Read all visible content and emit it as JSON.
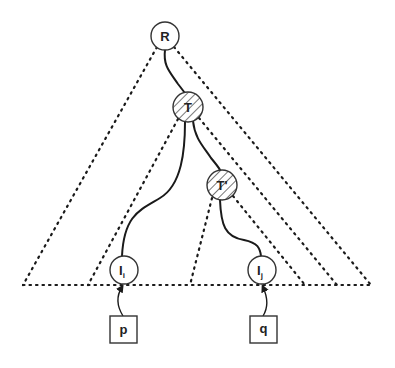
{
  "diagram": {
    "title": "",
    "colors": {
      "stroke": "#2a2a2a",
      "node_fill": "#ffffff",
      "hatch": "#555555",
      "background": "#ffffff"
    },
    "nodes": [
      {
        "id": "R",
        "label": "R",
        "cx": 165,
        "cy": 36,
        "r": 14,
        "hatched": false
      },
      {
        "id": "T",
        "label": "T",
        "cx": 188,
        "cy": 107,
        "r": 15,
        "hatched": true
      },
      {
        "id": "T_prime",
        "label": "T'",
        "cx": 222,
        "cy": 185,
        "r": 15,
        "hatched": true
      },
      {
        "id": "I_i",
        "label": "I",
        "sub": "i",
        "cx": 124,
        "cy": 270,
        "r": 14,
        "hatched": false
      },
      {
        "id": "I_j",
        "label": "I",
        "sub": "j",
        "cx": 262,
        "cy": 270,
        "r": 14,
        "hatched": false
      }
    ],
    "boxes": [
      {
        "id": "p",
        "label": "p",
        "x": 110,
        "y": 316,
        "w": 27,
        "h": 27
      },
      {
        "id": "q",
        "label": "q",
        "x": 250,
        "y": 316,
        "w": 27,
        "h": 27
      }
    ],
    "solid_edges": [
      {
        "from": "R",
        "to": "T"
      },
      {
        "from": "T",
        "to": "I_i"
      },
      {
        "from": "T",
        "to": "T_prime"
      },
      {
        "from": "T_prime",
        "to": "I_j"
      }
    ],
    "arrows": [
      {
        "from": "p",
        "to": "I_i"
      },
      {
        "from": "q",
        "to": "I_j"
      }
    ],
    "dotted_triangles": [
      {
        "name": "subtree-R",
        "apex_left": [
          157,
          47
        ],
        "apex_right": [
          174,
          47
        ],
        "base_left": [
          23,
          285
        ],
        "base_right": [
          371,
          285
        ]
      },
      {
        "name": "subtree-T",
        "apex_left": [
          178,
          119
        ],
        "apex_right": [
          199,
          118
        ],
        "base_left": [
          88,
          285
        ],
        "base_right": [
          337,
          285
        ]
      },
      {
        "name": "subtree-T-prime",
        "apex_left": [
          212,
          198
        ],
        "apex_right": [
          233,
          196
        ],
        "base_left": [
          190,
          285
        ],
        "base_right": [
          305,
          285
        ]
      }
    ],
    "baseline": {
      "x1": 23,
      "x2": 372,
      "y": 285
    }
  }
}
